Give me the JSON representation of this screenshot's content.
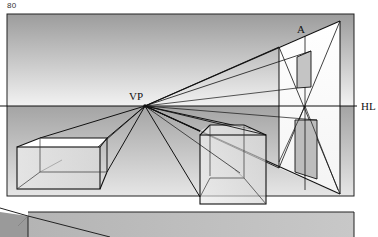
{
  "page": {
    "number": "80"
  },
  "diagram": {
    "labels": {
      "vanishing_point": "VP",
      "horizon_line": "HL",
      "point_a": "A"
    },
    "colors": {
      "line": "#111111",
      "sky_top": "#9a9a9a",
      "sky_bottom": "#f4f4f4",
      "ground_top": "#a8a8a8",
      "ground_bottom": "#e8e8e8",
      "paper": "#ffffff"
    },
    "elements": [
      {
        "name": "horizon-line",
        "label": "HL"
      },
      {
        "name": "vanishing-point",
        "label": "VP"
      },
      {
        "name": "left-box",
        "description": "wireframe rectangular box below horizon, left"
      },
      {
        "name": "center-box",
        "description": "wireframe cube below horizon, center-right"
      },
      {
        "name": "right-wall-construction",
        "description": "wall plane with diagonals locating center A and doorway"
      }
    ]
  }
}
